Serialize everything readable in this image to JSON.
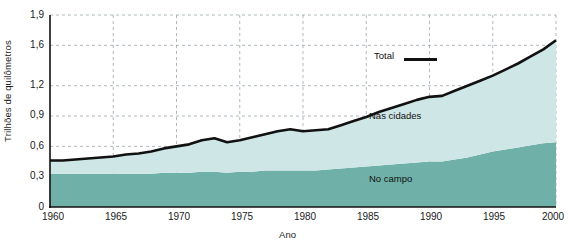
{
  "chart_data": {
    "type": "area",
    "title": "",
    "subtitle": "",
    "xlabel": "Ano",
    "ylabel": "Trilhões de quilômetros",
    "xlim": [
      1960,
      2000
    ],
    "ylim": [
      0,
      1.9
    ],
    "grid": true,
    "grid_style": "dashed",
    "xticks": [
      1960,
      1965,
      1970,
      1975,
      1980,
      1985,
      1990,
      1995,
      2000
    ],
    "xtick_labels": [
      "1960",
      "1965",
      "1970",
      "1975",
      "1980",
      "1985",
      "1990",
      "1995",
      "2000"
    ],
    "yticks": [
      0,
      0.3,
      0.6,
      0.9,
      1.2,
      1.6,
      1.9
    ],
    "ytick_labels": [
      "0",
      "0,3",
      "0,6",
      "0,9",
      "1,2",
      "1,6",
      "1,9"
    ],
    "legend_position": "inside-annotations",
    "stacked": true,
    "x": [
      1960,
      1961,
      1962,
      1963,
      1964,
      1965,
      1966,
      1967,
      1968,
      1969,
      1970,
      1971,
      1972,
      1973,
      1974,
      1975,
      1976,
      1977,
      1978,
      1979,
      1980,
      1981,
      1982,
      1983,
      1984,
      1985,
      1986,
      1987,
      1988,
      1989,
      1990,
      1991,
      1992,
      1993,
      1994,
      1995,
      1996,
      1997,
      1998,
      1999,
      2000
    ],
    "series": [
      {
        "name": "No campo",
        "label": "No campo",
        "color": "#6fb0a8",
        "values": [
          0.33,
          0.33,
          0.33,
          0.33,
          0.33,
          0.33,
          0.33,
          0.33,
          0.33,
          0.34,
          0.34,
          0.34,
          0.35,
          0.35,
          0.34,
          0.35,
          0.35,
          0.36,
          0.36,
          0.36,
          0.36,
          0.36,
          0.37,
          0.38,
          0.39,
          0.4,
          0.41,
          0.42,
          0.43,
          0.44,
          0.45,
          0.45,
          0.47,
          0.49,
          0.52,
          0.55,
          0.57,
          0.59,
          0.61,
          0.63,
          0.64
        ]
      },
      {
        "name": "Nas cidades",
        "label": "Nas cidades",
        "color": "#cfe6e6",
        "values": [
          0.13,
          0.13,
          0.14,
          0.15,
          0.16,
          0.17,
          0.19,
          0.2,
          0.22,
          0.24,
          0.26,
          0.28,
          0.31,
          0.33,
          0.3,
          0.31,
          0.34,
          0.36,
          0.39,
          0.41,
          0.39,
          0.4,
          0.4,
          0.43,
          0.46,
          0.49,
          0.53,
          0.56,
          0.59,
          0.62,
          0.64,
          0.65,
          0.68,
          0.71,
          0.73,
          0.75,
          0.79,
          0.83,
          0.88,
          0.93,
          1.01
        ]
      }
    ],
    "total": {
      "name": "Total",
      "label": "Total",
      "color": "#111111",
      "values": [
        0.46,
        0.46,
        0.47,
        0.48,
        0.49,
        0.5,
        0.52,
        0.53,
        0.55,
        0.58,
        0.6,
        0.62,
        0.66,
        0.68,
        0.64,
        0.66,
        0.69,
        0.72,
        0.75,
        0.77,
        0.75,
        0.76,
        0.77,
        0.81,
        0.85,
        0.89,
        0.94,
        0.98,
        1.02,
        1.06,
        1.09,
        1.1,
        1.15,
        1.2,
        1.25,
        1.3,
        1.36,
        1.42,
        1.49,
        1.56,
        1.65
      ]
    },
    "annotations": [
      {
        "text": "Total",
        "series": "total"
      },
      {
        "text": "Nas cidades",
        "series": "Nas cidades"
      },
      {
        "text": "No campo",
        "series": "No campo"
      }
    ]
  }
}
